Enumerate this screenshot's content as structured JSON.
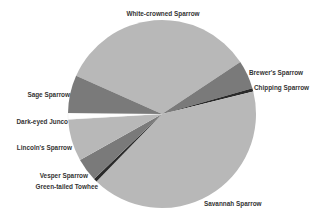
{
  "chart_data": {
    "type": "pie",
    "title": "",
    "start_slice": "White-crowned Sparrow",
    "direction": "clockwise",
    "slices": [
      {
        "label": "White-crowned Sparrow",
        "value": 34.0,
        "color": "#b8b8b8"
      },
      {
        "label": "Brewer's Sparrow",
        "value": 4.9,
        "color": "#7a7a7a"
      },
      {
        "label": "Chipping Sparrow",
        "value": 0.6,
        "color": "#2a2a2a"
      },
      {
        "label": "Savannah Sparrow",
        "value": 41.1,
        "color": "#b8b8b8"
      },
      {
        "label": "Green-tailed Towhee",
        "value": 0.6,
        "color": "#2a2a2a"
      },
      {
        "label": "Vesper Sparrow",
        "value": 4.0,
        "color": "#7a7a7a"
      },
      {
        "label": "Lincoln's Sparrow",
        "value": 7.2,
        "color": "#b8b8b8"
      },
      {
        "label": "Dark-eyed Junco",
        "value": 1.1,
        "color": "#ffffff"
      },
      {
        "label": "Sage Sparrow",
        "value": 6.5,
        "color": "#7a7a7a"
      }
    ],
    "legend": "none (labels placed next to slices)"
  }
}
